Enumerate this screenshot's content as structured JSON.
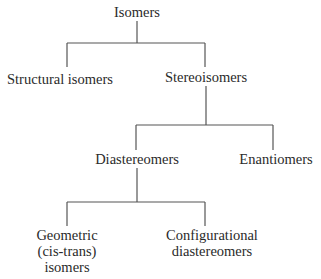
{
  "diagram": {
    "type": "tree",
    "title": "Isomers",
    "nodes": {
      "root": "Isomers",
      "structural": "Structural isomers",
      "stereo": "Stereoisomers",
      "diastereomers": "Diastereomers",
      "enantiomers": "Enantiomers",
      "geometric_line1": "Geometric",
      "geometric_line2": "(cis-trans)",
      "geometric_line3": "isomers",
      "configurational_line1": "Configurational",
      "configurational_line2": "diastereomers"
    },
    "edges": [
      [
        "Isomers",
        "Structural isomers"
      ],
      [
        "Isomers",
        "Stereoisomers"
      ],
      [
        "Stereoisomers",
        "Diastereomers"
      ],
      [
        "Stereoisomers",
        "Enantiomers"
      ],
      [
        "Diastereomers",
        "Geometric (cis-trans) isomers"
      ],
      [
        "Diastereomers",
        "Configurational diastereomers"
      ]
    ],
    "line_color": "#555555"
  }
}
